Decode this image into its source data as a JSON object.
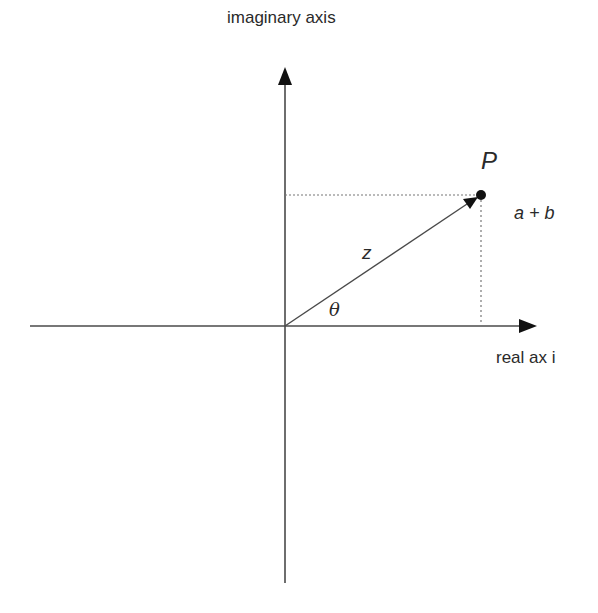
{
  "diagram": {
    "labels": {
      "imaginary_axis": "imaginary axis",
      "real_axis": "real ax i",
      "point": "P",
      "coordinates": "a + b",
      "modulus": "z",
      "angle": "θ"
    },
    "geometry": {
      "origin": [
        285,
        326
      ],
      "point_p": [
        481,
        195
      ],
      "horizontal_axis": {
        "x_start": 30,
        "x_end": 537
      },
      "vertical_axis": {
        "y_start": 583,
        "y_end": 68
      }
    },
    "colors": {
      "line": "#4a4a4a",
      "text": "#2a2a2a",
      "dotted": "#777777",
      "background": "#ffffff"
    }
  }
}
